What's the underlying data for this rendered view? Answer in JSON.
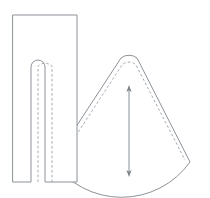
{
  "diagram": {
    "background_color": "#ffffff",
    "outline_color": "#8d9298",
    "seam_color": "#9aa0a6",
    "arrow_color": "#7d8389",
    "canvas": {
      "width": 210,
      "height": 198
    }
  },
  "pieces": [
    {
      "id": "rectangle-piece",
      "name": "Rectangular panel with U-shaped slit",
      "shape": "rectangle-with-slit",
      "outline_path": "M13,15 L77,15 L77,182 L45,182 L45,67 A7,7 0 0 0 31,67 L31,182 L13,182 Z",
      "seam_path": "M38,182 L38,66 A10.5,10.5 0 0 1 52,66 L52,182",
      "bounds": {
        "x": 13,
        "y": 15,
        "width": 64,
        "height": 167
      },
      "slit": {
        "left": 31,
        "right": 45,
        "top": 60,
        "bottom": 182,
        "radius": 7
      }
    },
    {
      "id": "cone-piece",
      "name": "Cone sector panel with rounded apex",
      "shape": "sector-with-rounded-apex",
      "outline_path": "M53,162 L121,58 A13,13 0 0 1 137,58 L190,162 A84,84 0 0 1 53,162 Z",
      "seam_path": "M60,160 L122,65 A10,10 0 0 1 136,65 L185,160",
      "bounds": {
        "x": 53,
        "y": 52,
        "width": 137,
        "height": 128
      },
      "apex": {
        "x": 129,
        "y": 55
      },
      "left_tip": {
        "x": 53,
        "y": 162
      },
      "right_tip": {
        "x": 190,
        "y": 162
      }
    }
  ],
  "annotations": [
    {
      "id": "height-dimension-arrow",
      "name": "Vertical double-headed dimension arrow",
      "type": "double-headed-arrow",
      "orientation": "vertical",
      "x": 129,
      "y_top": 86,
      "y_bottom": 176,
      "length_px": 90
    }
  ]
}
